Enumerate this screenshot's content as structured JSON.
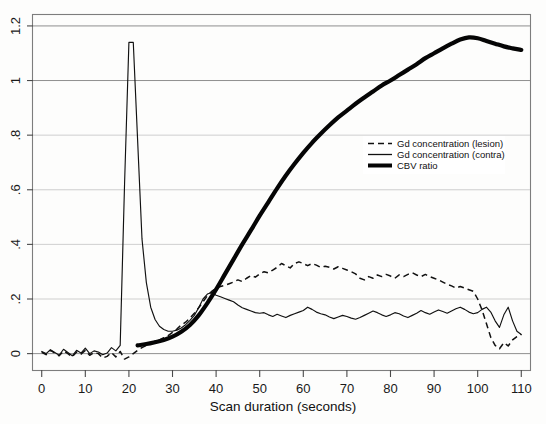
{
  "chart_data": {
    "type": "line",
    "title": "",
    "subtitle": "",
    "xlabel": "Scan duration (seconds)",
    "ylabel": "",
    "xlim": [
      -2,
      112
    ],
    "ylim": [
      -0.06,
      1.24
    ],
    "xticks": [
      0,
      10,
      20,
      30,
      40,
      50,
      60,
      70,
      80,
      90,
      100,
      110
    ],
    "xticklabels": [
      "0",
      "10",
      "20",
      "30",
      "40",
      "50",
      "60",
      "70",
      "80",
      "90",
      "100",
      "110"
    ],
    "yticks": [
      0,
      0.2,
      0.4,
      0.6,
      0.8,
      1,
      1.2
    ],
    "yticklabels": [
      "0",
      ".2",
      ".4",
      ".6",
      ".8",
      "1",
      "1.2"
    ],
    "grid": true,
    "grid_axis": "y",
    "legend_position": "center-right",
    "series": [
      {
        "name": "Gd concentration (lesion)",
        "style": "dashed",
        "color": "#111111",
        "x": [
          0,
          1,
          2,
          3,
          4,
          5,
          6,
          7,
          8,
          9,
          10,
          11,
          12,
          13,
          14,
          15,
          16,
          17,
          18,
          19,
          20,
          21,
          22,
          23,
          24,
          25,
          26,
          27,
          28,
          29,
          30,
          31,
          32,
          33,
          34,
          35,
          36,
          37,
          38,
          39,
          40,
          41,
          42,
          43,
          44,
          45,
          46,
          47,
          48,
          49,
          50,
          51,
          52,
          53,
          54,
          55,
          56,
          57,
          58,
          59,
          60,
          61,
          62,
          63,
          64,
          65,
          66,
          67,
          68,
          69,
          70,
          71,
          72,
          73,
          74,
          75,
          76,
          77,
          78,
          79,
          80,
          81,
          82,
          83,
          84,
          85,
          86,
          87,
          88,
          89,
          90,
          91,
          92,
          93,
          94,
          95,
          96,
          97,
          98,
          99,
          100,
          101,
          102,
          103,
          104,
          105,
          106,
          107,
          108,
          109,
          110
        ],
        "y": [
          0.005,
          -0.004,
          0.012,
          0.002,
          -0.008,
          0.01,
          0.0,
          -0.012,
          0.006,
          -0.002,
          0.012,
          -0.006,
          0.004,
          0.0,
          -0.016,
          -0.01,
          0.004,
          -0.012,
          0.008,
          -0.02,
          -0.012,
          0.0,
          0.012,
          0.022,
          0.03,
          0.036,
          0.042,
          0.05,
          0.058,
          0.066,
          0.078,
          0.09,
          0.105,
          0.115,
          0.13,
          0.148,
          0.168,
          0.19,
          0.212,
          0.228,
          0.24,
          0.246,
          0.25,
          0.256,
          0.262,
          0.27,
          0.264,
          0.276,
          0.286,
          0.28,
          0.292,
          0.3,
          0.296,
          0.306,
          0.316,
          0.33,
          0.322,
          0.314,
          0.33,
          0.336,
          0.33,
          0.322,
          0.33,
          0.324,
          0.316,
          0.32,
          0.316,
          0.31,
          0.318,
          0.312,
          0.306,
          0.3,
          0.292,
          0.276,
          0.27,
          0.282,
          0.276,
          0.288,
          0.282,
          0.29,
          0.284,
          0.276,
          0.288,
          0.282,
          0.29,
          0.296,
          0.288,
          0.282,
          0.29,
          0.282,
          0.276,
          0.27,
          0.262,
          0.254,
          0.248,
          0.24,
          0.246,
          0.24,
          0.234,
          0.228,
          0.2,
          0.16,
          0.11,
          0.06,
          0.03,
          0.018,
          0.04,
          0.028,
          0.05,
          0.062,
          0.07
        ]
      },
      {
        "name": "Gd concentration (contra)",
        "style": "solid-thin",
        "color": "#111111",
        "x": [
          0,
          1,
          2,
          3,
          4,
          5,
          6,
          7,
          8,
          9,
          10,
          11,
          12,
          13,
          14,
          15,
          16,
          17,
          18,
          19,
          20,
          21,
          22,
          23,
          24,
          25,
          26,
          27,
          28,
          29,
          30,
          31,
          32,
          33,
          34,
          35,
          36,
          37,
          38,
          39,
          40,
          41,
          42,
          43,
          44,
          45,
          46,
          47,
          48,
          49,
          50,
          51,
          52,
          53,
          54,
          55,
          56,
          57,
          58,
          59,
          60,
          61,
          62,
          63,
          64,
          65,
          66,
          67,
          68,
          69,
          70,
          71,
          72,
          73,
          74,
          75,
          76,
          77,
          78,
          79,
          80,
          81,
          82,
          83,
          84,
          85,
          86,
          87,
          88,
          89,
          90,
          91,
          92,
          93,
          94,
          95,
          96,
          97,
          98,
          99,
          100,
          101,
          102,
          103,
          104,
          105,
          106,
          107,
          108,
          109,
          110
        ],
        "y": [
          0.008,
          0.0,
          0.014,
          0.004,
          -0.006,
          0.016,
          0.004,
          -0.008,
          0.012,
          0.002,
          0.02,
          0.0,
          0.01,
          0.006,
          -0.004,
          0.002,
          0.022,
          0.01,
          0.03,
          0.62,
          1.14,
          1.14,
          0.78,
          0.42,
          0.26,
          0.17,
          0.125,
          0.1,
          0.088,
          0.082,
          0.082,
          0.086,
          0.094,
          0.106,
          0.122,
          0.14,
          0.168,
          0.2,
          0.218,
          0.224,
          0.214,
          0.208,
          0.202,
          0.196,
          0.19,
          0.178,
          0.168,
          0.162,
          0.156,
          0.15,
          0.148,
          0.15,
          0.142,
          0.136,
          0.144,
          0.138,
          0.132,
          0.14,
          0.146,
          0.152,
          0.158,
          0.17,
          0.162,
          0.152,
          0.146,
          0.142,
          0.134,
          0.128,
          0.134,
          0.14,
          0.136,
          0.13,
          0.126,
          0.132,
          0.14,
          0.148,
          0.156,
          0.15,
          0.142,
          0.136,
          0.142,
          0.15,
          0.146,
          0.138,
          0.132,
          0.14,
          0.148,
          0.158,
          0.15,
          0.144,
          0.152,
          0.16,
          0.154,
          0.148,
          0.156,
          0.164,
          0.17,
          0.162,
          0.152,
          0.146,
          0.15,
          0.162,
          0.17,
          0.152,
          0.12,
          0.096,
          0.142,
          0.17,
          0.12,
          0.082,
          0.07
        ]
      },
      {
        "name": "CBV ratio",
        "style": "solid-thick",
        "color": "#050505",
        "x": [
          22,
          24,
          26,
          28,
          30,
          32,
          34,
          36,
          38,
          40,
          42,
          44,
          46,
          48,
          50,
          52,
          54,
          56,
          58,
          60,
          62,
          64,
          66,
          68,
          70,
          72,
          74,
          76,
          78,
          80,
          82,
          84,
          86,
          88,
          90,
          92,
          94,
          96,
          98,
          100,
          102,
          104,
          106,
          108,
          110
        ],
        "y": [
          0.03,
          0.035,
          0.042,
          0.05,
          0.062,
          0.08,
          0.105,
          0.14,
          0.185,
          0.235,
          0.29,
          0.345,
          0.4,
          0.452,
          0.505,
          0.555,
          0.605,
          0.652,
          0.695,
          0.735,
          0.772,
          0.805,
          0.836,
          0.865,
          0.89,
          0.915,
          0.938,
          0.96,
          0.982,
          1.0,
          1.02,
          1.04,
          1.06,
          1.082,
          1.1,
          1.118,
          1.135,
          1.15,
          1.158,
          1.155,
          1.145,
          1.135,
          1.125,
          1.118,
          1.112
        ]
      }
    ]
  },
  "legend": {
    "entries": [
      {
        "label": "Gd concentration (lesion)",
        "style": "dashed"
      },
      {
        "label": "Gd concentration (contra)",
        "style": "solid-thin"
      },
      {
        "label": "CBV ratio",
        "style": "solid-thick"
      }
    ]
  },
  "axes": {
    "x_title": "Scan duration (seconds)"
  }
}
